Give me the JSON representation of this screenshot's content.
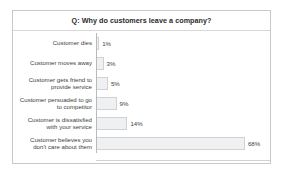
{
  "chart_data": {
    "type": "bar",
    "orientation": "horizontal",
    "title": "Q: Why do customers leave a company?",
    "xlabel": "",
    "ylabel": "",
    "xlim": [
      0,
      80
    ],
    "grid": false,
    "legend": false,
    "categories": [
      "Customer dies",
      "Customer moves away",
      "Customer gets friend to\nprovide service",
      "Customer persuaded to go\nto competitor",
      "Customer is dissatisfied\nwith your service",
      "Customer believes you\ndon't care about them"
    ],
    "values": [
      1,
      3,
      5,
      9,
      14,
      68
    ],
    "value_labels": [
      "1%",
      "3%",
      "5%",
      "9%",
      "14%",
      "68%"
    ],
    "bar_fill_color": "#eff0f2",
    "bar_border_color": "#cfd1d4",
    "axis_color": "#b9b9b9",
    "frame_border_color": "#c9c9c9",
    "text_color": "#3d3d3d"
  }
}
